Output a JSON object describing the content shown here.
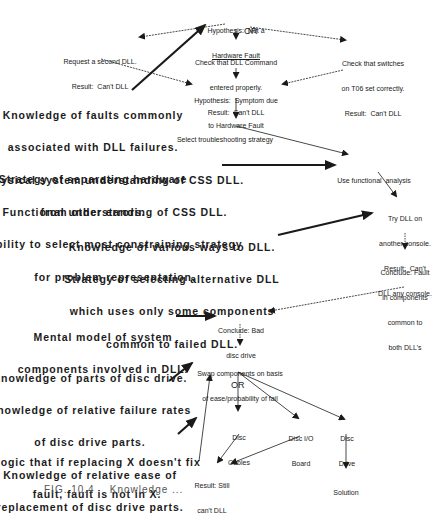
{
  "diagram": {
    "colors": {
      "ink": "#1a1a1a",
      "background": "#ffffff"
    },
    "nodes": {
      "hyp_not_hw": {
        "lines": [
          "Hypothesis:  Not a",
          "Hardware Fault"
        ]
      },
      "request_second": {
        "lines": [
          "Request a second DLL.",
          "Result:  Can't DLL"
        ]
      },
      "check_command": {
        "lines": [
          "Check that DLL Command",
          "entered properly.",
          "Result:  Can't DLL"
        ]
      },
      "check_switches": {
        "lines": [
          "Check that switches",
          "on T06 set correctly.",
          "Result:  Can't DLL"
        ]
      },
      "hyp_hw": {
        "lines": [
          "Hypothesis:  Symptom due",
          "to Hardware Fault"
        ]
      },
      "select_strategy": {
        "lines": [
          "Select troubleshooting strategy"
        ]
      },
      "functional": {
        "lines": [
          "Use functional  analysis"
        ]
      },
      "try_other": {
        "lines": [
          "Try DLL on",
          "another console.",
          "Result:  Can't",
          "DLL any console."
        ]
      },
      "fault_common": {
        "lines": [
          "Conclude: Fault",
          "in components",
          "common to",
          "both DLL's"
        ]
      },
      "bad_disc": {
        "lines": [
          "Conclude: Bad",
          "disc drive"
        ]
      },
      "swap": {
        "lines": [
          "Swap components on basis",
          "of ease/probability of fail"
        ]
      },
      "disc_cables": {
        "lines": [
          "Disc",
          "Cables"
        ]
      },
      "disc_io": {
        "lines": [
          "Disc I/O",
          "Board"
        ]
      },
      "disc_drive": {
        "lines": [
          "Disc",
          "Drive"
        ]
      },
      "still_cant": {
        "lines": [
          "Result: Still",
          "can't DLL"
        ]
      },
      "solution": {
        "lines": [
          "Solution"
        ]
      }
    },
    "or_labels": [
      "OR",
      "OR"
    ],
    "knowledge": {
      "k1": {
        "lines": [
          "Knowledge of faults commonly",
          "associated with DLL failures.",
          "Strategy of separating hardware",
          "from other errors."
        ]
      },
      "k2": {
        "lines": [
          "Physical system understanding of CSS DLL.",
          "Functional understanding of CSS DLL.",
          "Ability to select most constraining strategy",
          "for problem representation."
        ]
      },
      "k3": {
        "lines": [
          "Knowledge of various ways to DLL.",
          "Strategy of selecting alternative DLL",
          "which uses only some components",
          "common to failed DLL."
        ]
      },
      "k4": {
        "lines": [
          "Mental model of system",
          "components involved in DLL."
        ]
      },
      "k5": {
        "lines": [
          "Knowledge of parts of disc drive.",
          "Knowledge of relative failure rates",
          "of disc drive parts.",
          "Knowledge of relative ease of",
          "replacement of disc drive parts."
        ]
      },
      "k6": {
        "lines": [
          "Logic that if replacing X doesn't fix",
          "fault, fault is not in X."
        ]
      }
    },
    "caption": "FIG. 10.4    Knowledge ..."
  }
}
